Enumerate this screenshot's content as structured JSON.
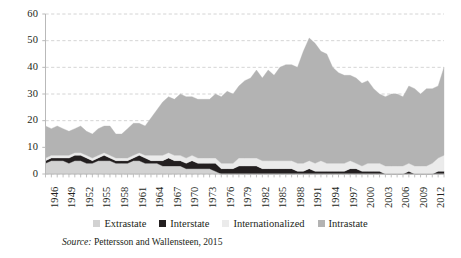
{
  "chart_data": {
    "type": "area",
    "stacked": true,
    "title": "",
    "subtitle": "",
    "xlabel": "",
    "ylabel": "",
    "ylim": [
      0,
      60
    ],
    "yticks": [
      0,
      10,
      20,
      30,
      40,
      50,
      60
    ],
    "ytick_labels": [
      "0",
      "10",
      "20",
      "30",
      "40",
      "50",
      "60"
    ],
    "grid": true,
    "grid_style": "dashed-horizontal",
    "legend_position": "bottom",
    "x": [
      1946,
      1947,
      1948,
      1949,
      1950,
      1951,
      1952,
      1953,
      1954,
      1955,
      1956,
      1957,
      1958,
      1959,
      1960,
      1961,
      1962,
      1963,
      1964,
      1965,
      1966,
      1967,
      1968,
      1969,
      1970,
      1971,
      1972,
      1973,
      1974,
      1975,
      1976,
      1977,
      1978,
      1979,
      1980,
      1981,
      1982,
      1983,
      1984,
      1985,
      1986,
      1987,
      1988,
      1989,
      1990,
      1991,
      1992,
      1993,
      1994,
      1995,
      1996,
      1997,
      1998,
      1999,
      2000,
      2001,
      2002,
      2003,
      2004,
      2005,
      2006,
      2007,
      2008,
      2009,
      2010,
      2011,
      2012,
      2013,
      2014
    ],
    "xtick_labels": [
      "1946",
      "1949",
      "1952",
      "1955",
      "1958",
      "1961",
      "1964",
      "1967",
      "1970",
      "1973",
      "1976",
      "1979",
      "1982",
      "1985",
      "1988",
      "1991",
      "1994",
      "1997",
      "2000",
      "2003",
      "2006",
      "2009",
      "2012"
    ],
    "xtick_interval": 3,
    "series": [
      {
        "name": "Extrastate",
        "color": "#d2d2d2",
        "values": [
          4,
          5,
          5,
          5,
          4,
          5,
          5,
          4,
          4,
          5,
          5,
          5,
          4,
          4,
          4,
          5,
          5,
          4,
          4,
          4,
          3,
          3,
          3,
          3,
          2,
          2,
          2,
          2,
          2,
          1,
          0,
          0,
          0,
          0,
          0,
          0,
          0,
          0,
          0,
          0,
          0,
          0,
          0,
          0,
          0,
          0,
          0,
          0,
          0,
          0,
          0,
          0,
          0,
          0,
          0,
          0,
          0,
          0,
          0,
          0,
          0,
          0,
          0,
          0,
          0,
          0,
          0,
          0,
          0
        ]
      },
      {
        "name": "Interstate",
        "color": "#231f20",
        "values": [
          1,
          1,
          1,
          1,
          2,
          2,
          2,
          2,
          1,
          1,
          2,
          1,
          1,
          1,
          1,
          1,
          2,
          2,
          1,
          1,
          2,
          3,
          2,
          2,
          2,
          3,
          2,
          2,
          2,
          3,
          2,
          2,
          2,
          3,
          3,
          3,
          3,
          2,
          2,
          2,
          2,
          2,
          2,
          1,
          1,
          2,
          1,
          1,
          1,
          1,
          1,
          1,
          2,
          2,
          1,
          1,
          1,
          1,
          0,
          0,
          0,
          0,
          1,
          0,
          0,
          0,
          0,
          1,
          1
        ]
      },
      {
        "name": "Internationalized",
        "color": "#ebebeb",
        "values": [
          1,
          1,
          1,
          1,
          1,
          1,
          1,
          1,
          1,
          1,
          1,
          1,
          1,
          1,
          1,
          1,
          1,
          1,
          2,
          2,
          2,
          2,
          2,
          2,
          2,
          2,
          2,
          2,
          2,
          2,
          2,
          2,
          2,
          3,
          3,
          3,
          3,
          3,
          3,
          3,
          3,
          3,
          3,
          3,
          3,
          3,
          3,
          4,
          3,
          3,
          3,
          3,
          3,
          2,
          2,
          3,
          3,
          3,
          3,
          3,
          3,
          3,
          3,
          3,
          3,
          3,
          4,
          5,
          6
        ]
      },
      {
        "name": "Intrastate",
        "color": "#b3b3b3",
        "values": [
          12,
          10,
          11,
          10,
          9,
          9,
          10,
          9,
          9,
          10,
          10,
          11,
          9,
          9,
          11,
          12,
          11,
          11,
          14,
          17,
          20,
          21,
          21,
          23,
          23,
          22,
          22,
          22,
          22,
          24,
          25,
          27,
          26,
          27,
          29,
          30,
          33,
          31,
          34,
          32,
          35,
          36,
          36,
          36,
          42,
          46,
          45,
          41,
          41,
          36,
          34,
          33,
          32,
          32,
          31,
          31,
          28,
          26,
          26,
          27,
          27,
          26,
          29,
          29,
          27,
          29,
          28,
          27,
          33
        ]
      }
    ],
    "legend": [
      {
        "label": "Extrastate",
        "color": "#d2d2d2"
      },
      {
        "label": "Interstate",
        "color": "#231f20"
      },
      {
        "label": "Internationalized",
        "color": "#ebebeb"
      },
      {
        "label": "Intrastate",
        "color": "#b3b3b3"
      }
    ],
    "source_prefix": "Source:",
    "source_text": " Pettersson and Wallensteen, 2015"
  },
  "axis": {
    "axis_color": "#b9b9b9",
    "grid_color": "#c9c9c9",
    "text_color": "#231f20"
  }
}
